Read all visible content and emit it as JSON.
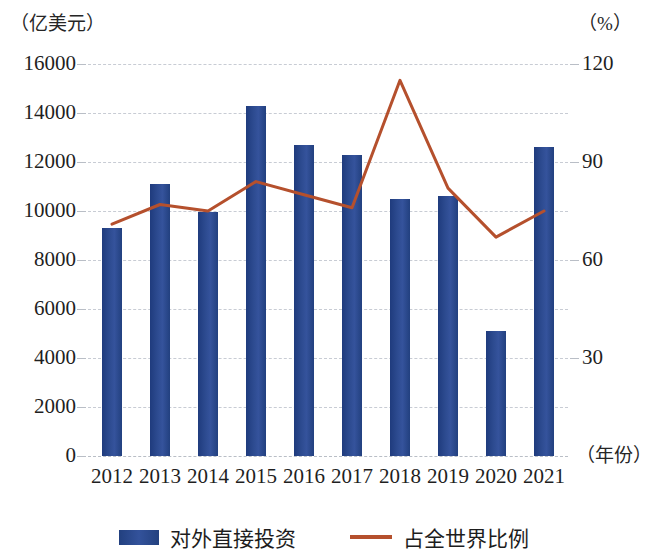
{
  "axes": {
    "left_unit": "（亿美元）",
    "right_unit": "（%）",
    "x_unit": "（年份）",
    "left_ticks": [
      "16000",
      "14000",
      "12000",
      "10000",
      "8000",
      "6000",
      "4000",
      "2000",
      "0"
    ],
    "right_ticks": [
      "120",
      "90",
      "60",
      "30"
    ]
  },
  "legend": {
    "items": [
      {
        "label": "对外直接投资",
        "marker": "bar-swatch",
        "color": "#2c4a8f"
      },
      {
        "label": "占全世界比例",
        "marker": "line-swatch",
        "color": "#b5502d"
      }
    ]
  },
  "chart_data": {
    "type": "bar",
    "title": "",
    "xlabel": "（年份）",
    "ylabel": "（亿美元）",
    "y2label": "（%）",
    "categories": [
      "2012",
      "2013",
      "2014",
      "2015",
      "2016",
      "2017",
      "2018",
      "2019",
      "2020",
      "2021"
    ],
    "ylim": [
      0,
      16000
    ],
    "y2lim": [
      0,
      120
    ],
    "grid": true,
    "legend_position": "bottom-center",
    "series": [
      {
        "name": "对外直接投资",
        "type": "bar",
        "axis": "left",
        "color": "#2c4a8f",
        "unit": "亿美元",
        "values": [
          9300,
          11100,
          9950,
          14300,
          12700,
          12300,
          10500,
          10600,
          5100,
          12600
        ]
      },
      {
        "name": "占全世界比例",
        "type": "line",
        "axis": "right",
        "color": "#b5502d",
        "unit": "%",
        "values": [
          71,
          77,
          75,
          84,
          80,
          76,
          115,
          82,
          67,
          75
        ]
      }
    ]
  }
}
